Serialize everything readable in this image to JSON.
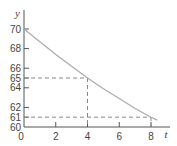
{
  "chart_data": {
    "type": "line",
    "title": "",
    "xlabel": "t",
    "ylabel": "y",
    "xlim": [
      0,
      9
    ],
    "ylim": [
      60,
      71
    ],
    "x_ticks": [
      0,
      2,
      4,
      6,
      8
    ],
    "y_ticks": [
      60,
      61,
      62,
      64,
      65,
      66,
      68,
      70
    ],
    "x_tick_labels": [
      "0",
      "2",
      "4",
      "6",
      "8"
    ],
    "y_tick_labels": [
      "60",
      "61",
      "62",
      "64",
      "65",
      "66",
      "68",
      "70"
    ],
    "grid": false,
    "series": [
      {
        "name": "y(t)",
        "x": [
          0,
          1,
          2,
          3,
          4,
          5,
          6,
          7,
          8,
          8.4
        ],
        "y": [
          70,
          68.7,
          67.4,
          66.2,
          65,
          63.9,
          62.9,
          61.9,
          61,
          60.7
        ]
      }
    ],
    "reference_points": [
      {
        "x": 4,
        "y": 65
      },
      {
        "x": 8,
        "y": 61
      }
    ],
    "colors": {
      "axis": "#555555",
      "curve": "#aaaaaa",
      "dash": "#888888",
      "text": "#444444"
    }
  }
}
